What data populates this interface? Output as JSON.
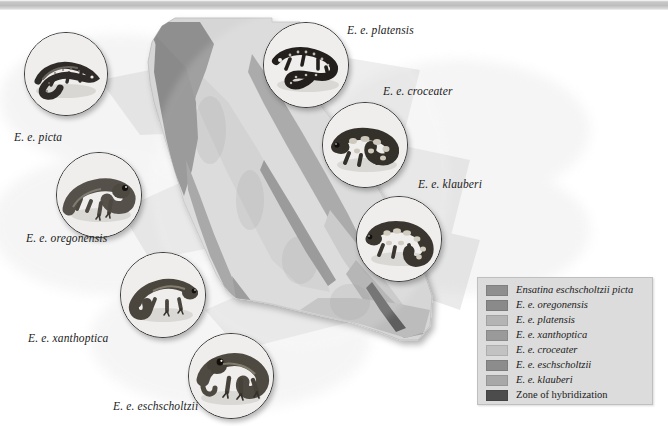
{
  "banner": {
    "text": ""
  },
  "specimens": [
    {
      "id": "picta",
      "label": "E. e. picta"
    },
    {
      "id": "oregonensis",
      "label": "E. e. oregonensis"
    },
    {
      "id": "platensis",
      "label": "E. e. platensis"
    },
    {
      "id": "croceater",
      "label": "E. e. croceater"
    },
    {
      "id": "klauberi",
      "label": "E. e. klauberi"
    },
    {
      "id": "xanthoptica",
      "label": "E. e. xanthoptica"
    },
    {
      "id": "eschscholtzii",
      "label": "E. e. eschscholtzii"
    }
  ],
  "legend": {
    "items": [
      {
        "label": "Ensatina eschscholtzii picta",
        "color": "#8f8f8f",
        "italic": true
      },
      {
        "label": "E. e. oregonensis",
        "color": "#8a8a8a",
        "italic": true
      },
      {
        "label": "E. e. platensis",
        "color": "#b4b4b4",
        "italic": true
      },
      {
        "label": "E. e. xanthoptica",
        "color": "#9a9a9a",
        "italic": true
      },
      {
        "label": "E. e. croceater",
        "color": "#c2c2c2",
        "italic": true
      },
      {
        "label": "E. e. eschscholtzii",
        "color": "#8c8c8c",
        "italic": true
      },
      {
        "label": "E. e. klauberi",
        "color": "#a8a8a8",
        "italic": true
      },
      {
        "label": "Zone of hybridization",
        "color": "#4c4c4c",
        "italic": false
      }
    ]
  },
  "map": {
    "colors": {
      "background": "#ffffff",
      "state_fill": "#d5d5d5",
      "central_valley": "#c8c8c8",
      "coast_band": "#a5a5a5",
      "sierra_band": "#9d9d9d",
      "north_band": "#8e8e8e",
      "south_band": "#b8b8b8",
      "hybrid_zone": "#6f6f6f",
      "pale_halo": "#ededed",
      "shadow": "rgba(0,0,0,0.18)"
    }
  }
}
